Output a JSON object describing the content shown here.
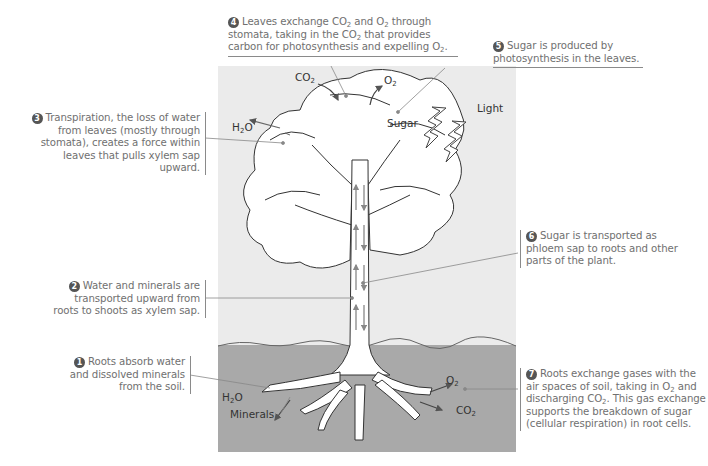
{
  "diagram": {
    "colors": {
      "sky": "#ebebeb",
      "soil": "#a9a9a9",
      "text": "#707070",
      "label": "#333333",
      "badge": "#555555"
    },
    "callouts": [
      {
        "id": 1,
        "badge": "1",
        "lines": [
          "Roots absorb water",
          "and dissolved minerals",
          "from the soil."
        ]
      },
      {
        "id": 2,
        "badge": "2",
        "lines": [
          "Water and minerals are",
          "transported upward from",
          "roots to shoots as xylem sap."
        ]
      },
      {
        "id": 3,
        "badge": "3",
        "lines": [
          "Transpiration, the loss of water",
          "from leaves (mostly through",
          "stomata), creates a force within",
          "leaves that pulls xylem sap upward."
        ]
      },
      {
        "id": 4,
        "badge": "4",
        "pre1": "Leaves exchange CO",
        "sub1": "2",
        "mid1": " and O",
        "sub2": "2",
        "post1": " through",
        "line2a": "stomata, taking in the CO",
        "sub3": "2",
        "line2b": " that provides",
        "line3a": "carbon for photosynthesis and expelling O",
        "sub4": "2",
        "line3b": "."
      },
      {
        "id": 5,
        "badge": "5",
        "lines": [
          "Sugar is produced by",
          "photosynthesis in the leaves."
        ]
      },
      {
        "id": 6,
        "badge": "6",
        "lines": [
          "Sugar is transported as",
          "phloem sap to roots and other",
          "parts of the plant."
        ]
      },
      {
        "id": 7,
        "badge": "7",
        "line1": "Roots exchange gases with the",
        "line2a": "air spaces of soil, taking in O",
        "sub1": "2",
        "line2b": " and",
        "line3a": "discharging CO",
        "sub2": "2",
        "line3b": ". This gas exchange",
        "line4": "supports the breakdown of sugar",
        "line5": "(cellular respiration) in root cells."
      }
    ],
    "labels": {
      "co2_top": "CO",
      "co2_top_sub": "2",
      "o2_top": "O",
      "o2_top_sub": "2",
      "h2o_leaf": "H",
      "h2o_leaf_sub": "2",
      "h2o_leaf_end": "O",
      "sugar": "Sugar",
      "light": "Light",
      "h2o_root": "H",
      "h2o_root_sub": "2",
      "h2o_root_end": "O",
      "minerals": "Minerals",
      "o2_root": "O",
      "o2_root_sub": "2",
      "co2_root": "CO",
      "co2_root_sub": "2"
    }
  }
}
